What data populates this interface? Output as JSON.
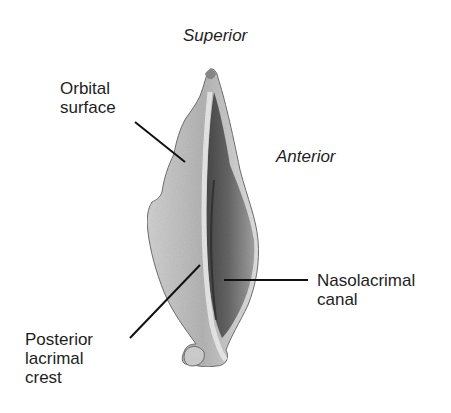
{
  "figure": {
    "orientation_labels": {
      "superior": "Superior",
      "anterior": "Anterior"
    },
    "structure_labels": [
      {
        "id": "orbital-surface",
        "line1": "Orbital",
        "line2": "surface"
      },
      {
        "id": "nasolacrimal-canal",
        "line1": "Nasolacrimal",
        "line2": "canal"
      },
      {
        "id": "posterior-lacrimal-crest",
        "line1": "Posterior",
        "line2": "lacrimal",
        "line3": "crest"
      }
    ],
    "colors": {
      "background": "#ffffff",
      "text": "#1e1e1e",
      "leader_line": "#111111",
      "bone_light": "#d8d8d8",
      "bone_mid": "#a8a8a8",
      "bone_dark": "#4a4a4a",
      "outline": "#6e6e6e"
    }
  }
}
